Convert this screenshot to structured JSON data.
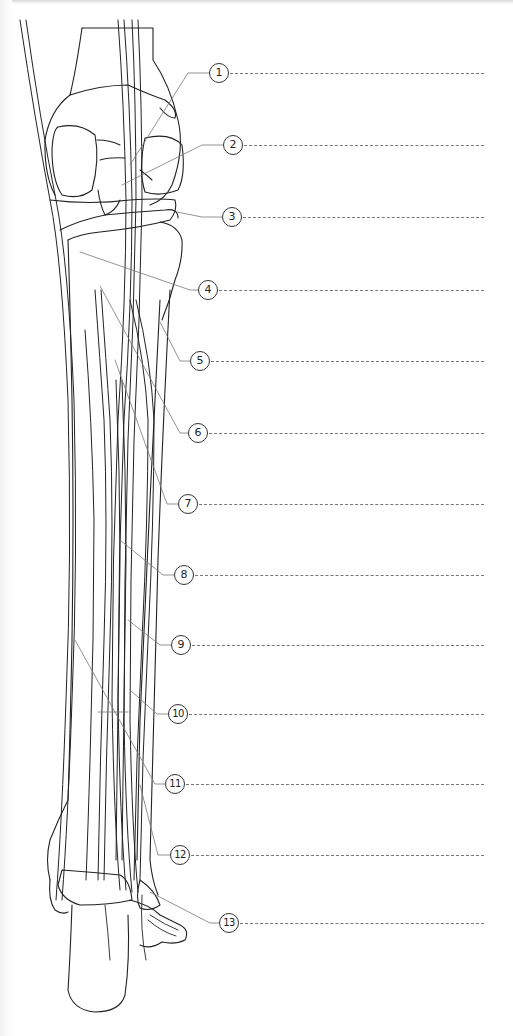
{
  "diagram": {
    "callouts": [
      {
        "number": "1",
        "x": 219,
        "y": 73
      },
      {
        "number": "2",
        "x": 233,
        "y": 145
      },
      {
        "number": "3",
        "x": 232,
        "y": 217
      },
      {
        "number": "4",
        "x": 218,
        "y": 290
      },
      {
        "number": "5",
        "x": 210,
        "y": 361
      },
      {
        "number": "6",
        "x": 208,
        "y": 433
      },
      {
        "number": "7",
        "x": 198,
        "y": 504
      },
      {
        "number": "8",
        "x": 194,
        "y": 575
      },
      {
        "number": "9",
        "x": 191,
        "y": 645
      },
      {
        "number": "10",
        "x": 188,
        "y": 714
      },
      {
        "number": "11",
        "x": 185,
        "y": 784
      },
      {
        "number": "12",
        "x": 180,
        "y": 855
      },
      {
        "number": "13",
        "x": 229,
        "y": 923
      }
    ],
    "answer_line_end_x": 484,
    "colors": {
      "line": "#222222",
      "leader": "#777777",
      "background": "#ffffff"
    }
  }
}
